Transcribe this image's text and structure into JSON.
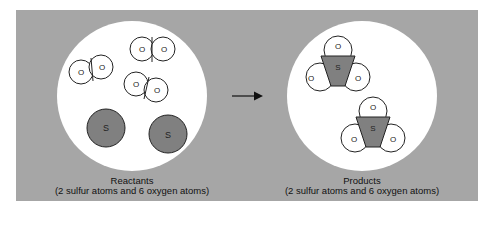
{
  "colors": {
    "panel_bg": "#a6a6a6",
    "circle_bg": "#ffffff",
    "sulfur_fill": "#808080",
    "outline": "#222222"
  },
  "reactants": {
    "title": "Reactants",
    "subtitle": "(2 sulfur atoms and 6 oxygen atoms)",
    "oxygen_label": "O",
    "sulfur_label": "S"
  },
  "products": {
    "title": "Products",
    "subtitle": "(2 sulfur atoms and 6 oxygen atoms)",
    "oxygen_label": "O",
    "sulfur_label": "S"
  },
  "arrow": "reaction-arrow"
}
